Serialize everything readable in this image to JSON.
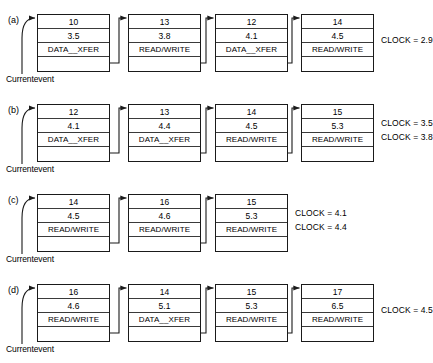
{
  "diagram": {
    "title_caption": "",
    "current_event_label": "Currentevent",
    "node_fields": [
      "event_number",
      "event_time",
      "event_type",
      "link"
    ],
    "event_types": {
      "data_xfer": "DATA__XFER",
      "read_write": "READ/WRITE"
    },
    "rows": [
      {
        "label": "(a)",
        "nodes": [
          {
            "number": "10",
            "time": "3.5",
            "type": "DATA__XFER"
          },
          {
            "number": "13",
            "time": "3.8",
            "type": "READ/WRITE"
          },
          {
            "number": "12",
            "time": "4.1",
            "type": "DATA__XFER"
          },
          {
            "number": "14",
            "time": "4.5",
            "type": "READ/WRITE"
          }
        ],
        "clocks": [
          "CLOCK = 2.9"
        ]
      },
      {
        "label": "(b)",
        "nodes": [
          {
            "number": "12",
            "time": "4.1",
            "type": "DATA__XFER"
          },
          {
            "number": "13",
            "time": "4.4",
            "type": "DATA__XFER"
          },
          {
            "number": "14",
            "time": "4.5",
            "type": "READ/WRITE"
          },
          {
            "number": "15",
            "time": "5.3",
            "type": "READ/WRITE"
          }
        ],
        "clocks": [
          "CLOCK = 3.5",
          "CLOCK = 3.8"
        ]
      },
      {
        "label": "(c)",
        "nodes": [
          {
            "number": "14",
            "time": "4.5",
            "type": "READ/WRITE"
          },
          {
            "number": "16",
            "time": "4.6",
            "type": "READ/WRITE"
          },
          {
            "number": "15",
            "time": "5.3",
            "type": "READ/WRITE"
          }
        ],
        "clocks": [
          "CLOCK = 4.1",
          "CLOCK = 4.4"
        ]
      },
      {
        "label": "(d)",
        "nodes": [
          {
            "number": "16",
            "time": "4.6",
            "type": "READ/WRITE"
          },
          {
            "number": "14",
            "time": "5.1",
            "type": "DATA__XFER"
          },
          {
            "number": "15",
            "time": "5.3",
            "type": "READ/WRITE"
          },
          {
            "number": "17",
            "time": "6.5",
            "type": "READ/WRITE"
          }
        ],
        "clocks": [
          "CLOCK = 4.5"
        ]
      }
    ]
  },
  "colors": {
    "ink": "#1a1a1a",
    "rule": "#3a3a3a",
    "background": "#ffffff"
  }
}
